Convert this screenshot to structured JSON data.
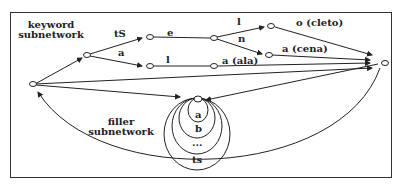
{
  "subnetworks": {
    "keyword": {
      "line1": "keyword",
      "line2": "subnetwork"
    },
    "filler": {
      "line1": "filler",
      "line2": "subnetwork"
    }
  },
  "arcs": {
    "tS": "tS",
    "a1": "a",
    "e": "e",
    "l1": "l",
    "l2": "l",
    "n": "n",
    "o_cleto": "o (cleto)",
    "a_cena": "a (cena)",
    "a_ala": "a (ala)"
  },
  "filler_loops": [
    "a",
    "b",
    "...",
    "ts"
  ],
  "colors": {
    "line": "#222222",
    "background": "#ffffff"
  }
}
